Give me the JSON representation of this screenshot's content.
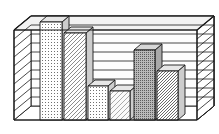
{
  "figure": {
    "title": "",
    "style": "3d-bar-chart-monochrome",
    "background_color": "#ffffff",
    "line_color": "#1a1a1a",
    "frame_label": "3D perspective plot box with horizontal gridlines"
  },
  "chart_data": {
    "type": "bar",
    "title": "",
    "subtitle": "",
    "xlabel": "",
    "ylabel": "",
    "categories": [
      "1",
      "2",
      "3",
      "4",
      "5",
      "6"
    ],
    "values": [
      8.6,
      7.5,
      2.6,
      2.1,
      6.1,
      3.8
    ],
    "ylim": [
      0,
      10
    ],
    "xlim": [
      0,
      6
    ],
    "grid": true,
    "gridlines": 10,
    "legend": false,
    "legend_position": "none",
    "annotations": [],
    "series": [
      {
        "name": "Series 1",
        "values": [
          8.6,
          7.5,
          2.6,
          2.1,
          6.1,
          3.8
        ]
      }
    ],
    "bar_patterns": [
      "fine-dots",
      "diagonal-hatch-up",
      "fine-dots",
      "diagonal-hatch-up-light",
      "dense-stipple-dark",
      "diagonal-hatch-up-dense"
    ],
    "bar_face_tones": [
      "#f0f0f0",
      "#f4f4f4",
      "#e8e8e8",
      "#f4f4f4",
      "#b8b8b8",
      "#f2f2f2"
    ],
    "bar_top_tone": "#e2e2e2",
    "bar_side_tone": "#cfcfcf"
  },
  "geometry": {
    "plot_box": {
      "front_left_x": 14,
      "front_right_x": 197,
      "front_bottom_y": 120,
      "front_top_y": 30,
      "depth_dx": 17,
      "depth_dy": -14
    },
    "bars": [
      {
        "name": "bar-1",
        "x": 40,
        "w": 22,
        "top_y": 22
      },
      {
        "name": "bar-2",
        "x": 64,
        "w": 22,
        "top_y": 33
      },
      {
        "name": "bar-3",
        "x": 88,
        "w": 20,
        "top_y": 86
      },
      {
        "name": "bar-4",
        "x": 110,
        "w": 20,
        "top_y": 91
      },
      {
        "name": "bar-5",
        "x": 134,
        "w": 21,
        "top_y": 50
      },
      {
        "name": "bar-6",
        "x": 157,
        "w": 21,
        "top_y": 71
      }
    ]
  }
}
